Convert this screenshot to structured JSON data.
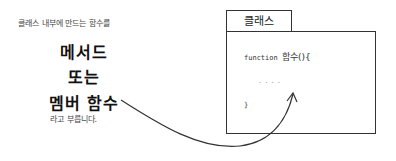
{
  "left_text": {
    "intro": "클래스 내부에 만드는 함수를",
    "term1": "메서드",
    "conjunction": "또는",
    "term2": "멤버 함수",
    "outro": "라고 부릅니다."
  },
  "class_box": {
    "tab_label": "클래스",
    "code_line1_keyword": "function",
    "code_line1_name": "함수(){",
    "code_line2": "....",
    "code_line3": "}"
  }
}
